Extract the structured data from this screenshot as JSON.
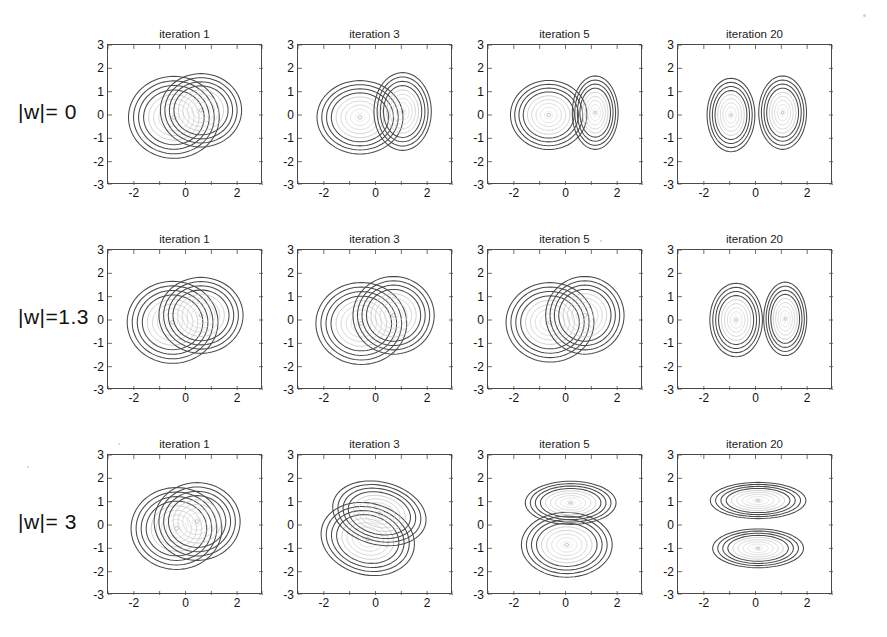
{
  "figure": {
    "type": "contour-plot-grid",
    "rows": 3,
    "cols": 4,
    "background": "#ffffff",
    "contour_color": "#4a4a4a"
  },
  "column_titles": [
    "iteration 1",
    "iteration 3",
    "iteration 5",
    "iteration 20"
  ],
  "row_labels": [
    "|w|= 0",
    "|w|=1.3",
    "|w|= 3"
  ],
  "axes": {
    "xticks": [
      "-2",
      "0",
      "2"
    ],
    "xtick_values": [
      -2,
      0,
      2
    ],
    "yticks": [
      "3",
      "2",
      "1",
      "0",
      "-1",
      "-2",
      "-3"
    ],
    "ytick_values": [
      3,
      2,
      1,
      0,
      -1,
      -2,
      -3
    ],
    "xlim": [
      -3,
      3
    ],
    "ylim": [
      -3,
      3
    ],
    "xlabel": "",
    "ylabel": "",
    "grid": false
  },
  "chart_data": {
    "type": "contour",
    "title": "",
    "xlabel": "",
    "ylabel": "",
    "xlim": [
      -3,
      3
    ],
    "ylim": [
      -3,
      3
    ],
    "grid": false,
    "legend": "none",
    "contour_levels": 9,
    "rows": [
      {
        "row_label": "|w|= 0",
        "panels": [
          {
            "title": "iteration 1",
            "components": [
              {
                "name": "component-1",
                "mean": [
                  -0.45,
                  -0.1
                ],
                "sigma_x": 0.95,
                "sigma_y": 0.95,
                "rotation_deg": 0
              },
              {
                "name": "component-2",
                "mean": [
                  0.6,
                  0.2
                ],
                "sigma_x": 0.85,
                "sigma_y": 0.85,
                "rotation_deg": 0
              }
            ]
          },
          {
            "title": "iteration 3",
            "components": [
              {
                "name": "component-1",
                "mean": [
                  -0.6,
                  -0.1
                ],
                "sigma_x": 0.9,
                "sigma_y": 0.85,
                "rotation_deg": 0
              },
              {
                "name": "component-2",
                "mean": [
                  1.05,
                  0.15
                ],
                "sigma_x": 0.6,
                "sigma_y": 0.9,
                "rotation_deg": 0
              }
            ]
          },
          {
            "title": "iteration 5",
            "components": [
              {
                "name": "component-1",
                "mean": [
                  -0.65,
                  0.0
                ],
                "sigma_x": 0.8,
                "sigma_y": 0.8,
                "rotation_deg": 0
              },
              {
                "name": "component-2",
                "mean": [
                  1.15,
                  0.1
                ],
                "sigma_x": 0.48,
                "sigma_y": 0.85,
                "rotation_deg": 0
              }
            ]
          },
          {
            "title": "iteration 20",
            "components": [
              {
                "name": "component-1",
                "mean": [
                  -0.95,
                  0.0
                ],
                "sigma_x": 0.5,
                "sigma_y": 0.85,
                "rotation_deg": 0
              },
              {
                "name": "component-2",
                "mean": [
                  1.05,
                  0.1
                ],
                "sigma_x": 0.5,
                "sigma_y": 0.85,
                "rotation_deg": 0
              }
            ]
          }
        ]
      },
      {
        "row_label": "|w|=1.3",
        "panels": [
          {
            "title": "iteration 1",
            "components": [
              {
                "name": "component-1",
                "mean": [
                  -0.5,
                  -0.1
                ],
                "sigma_x": 0.95,
                "sigma_y": 0.95,
                "rotation_deg": 0
              },
              {
                "name": "component-2",
                "mean": [
                  0.6,
                  0.2
                ],
                "sigma_x": 0.88,
                "sigma_y": 0.88,
                "rotation_deg": 0
              }
            ]
          },
          {
            "title": "iteration 3",
            "components": [
              {
                "name": "component-1",
                "mean": [
                  -0.55,
                  -0.15
                ],
                "sigma_x": 0.95,
                "sigma_y": 0.95,
                "rotation_deg": 0
              },
              {
                "name": "component-2",
                "mean": [
                  0.7,
                  0.2
                ],
                "sigma_x": 0.85,
                "sigma_y": 0.9,
                "rotation_deg": 0
              }
            ]
          },
          {
            "title": "iteration 5",
            "components": [
              {
                "name": "component-1",
                "mean": [
                  -0.6,
                  -0.1
                ],
                "sigma_x": 0.92,
                "sigma_y": 0.92,
                "rotation_deg": 0
              },
              {
                "name": "component-2",
                "mean": [
                  0.75,
                  0.2
                ],
                "sigma_x": 0.82,
                "sigma_y": 0.9,
                "rotation_deg": 0
              }
            ]
          },
          {
            "title": "iteration 20",
            "components": [
              {
                "name": "component-1",
                "mean": [
                  -0.75,
                  0.0
                ],
                "sigma_x": 0.55,
                "sigma_y": 0.85,
                "rotation_deg": 0
              },
              {
                "name": "component-2",
                "mean": [
                  1.15,
                  0.05
                ],
                "sigma_x": 0.45,
                "sigma_y": 0.85,
                "rotation_deg": 0
              }
            ]
          }
        ]
      },
      {
        "row_label": "|w|= 3",
        "panels": [
          {
            "title": "iteration 1",
            "components": [
              {
                "name": "component-1",
                "mean": [
                  -0.35,
                  -0.15
                ],
                "sigma_x": 0.95,
                "sigma_y": 0.95,
                "rotation_deg": 0
              },
              {
                "name": "component-2",
                "mean": [
                  0.45,
                  0.15
                ],
                "sigma_x": 0.9,
                "sigma_y": 0.9,
                "rotation_deg": 0
              }
            ]
          },
          {
            "title": "iteration 3",
            "components": [
              {
                "name": "component-1",
                "mean": [
                  -0.3,
                  -0.6
                ],
                "sigma_x": 1.0,
                "sigma_y": 0.82,
                "rotation_deg": -22
              },
              {
                "name": "component-2",
                "mean": [
                  0.15,
                  0.5
                ],
                "sigma_x": 1.0,
                "sigma_y": 0.72,
                "rotation_deg": -18
              }
            ]
          },
          {
            "title": "iteration 5",
            "components": [
              {
                "name": "component-1",
                "mean": [
                  0.05,
                  -0.85
                ],
                "sigma_x": 0.95,
                "sigma_y": 0.75,
                "rotation_deg": 0
              },
              {
                "name": "component-2",
                "mean": [
                  0.2,
                  0.95
                ],
                "sigma_x": 0.95,
                "sigma_y": 0.5,
                "rotation_deg": 0
              }
            ]
          },
          {
            "title": "iteration 20",
            "components": [
              {
                "name": "component-1",
                "mean": [
                  0.1,
                  -1.0
                ],
                "sigma_x": 0.95,
                "sigma_y": 0.45,
                "rotation_deg": 0
              },
              {
                "name": "component-2",
                "mean": [
                  0.1,
                  1.05
                ],
                "sigma_x": 1.0,
                "sigma_y": 0.42,
                "rotation_deg": 0
              }
            ]
          }
        ]
      }
    ]
  }
}
